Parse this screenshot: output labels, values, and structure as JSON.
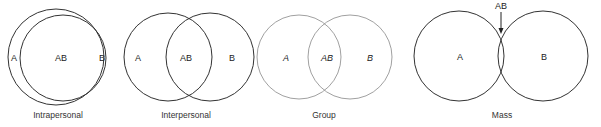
{
  "diagrams": [
    {
      "caption": "Intrapersonal",
      "labels": {
        "a": "A",
        "ab": "AB",
        "b": "B"
      },
      "stroke": "#333333"
    },
    {
      "caption": "Interpersonal",
      "labels": {
        "a": "A",
        "ab": "AB",
        "b": "B"
      },
      "stroke": "#333333"
    },
    {
      "caption": "Group",
      "labels": {
        "a": "A",
        "ab": "AB",
        "b": "B"
      },
      "stroke": "#777777"
    },
    {
      "caption": "Mass",
      "labels": {
        "a": "A",
        "ab": "AB",
        "b": "B"
      },
      "stroke": "#333333"
    }
  ]
}
